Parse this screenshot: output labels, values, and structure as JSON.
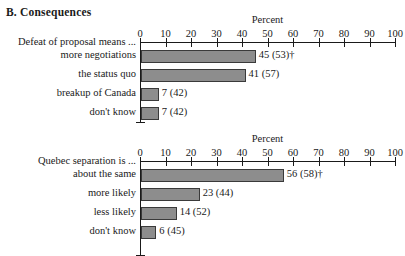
{
  "panel": {
    "title": "B. Consequences"
  },
  "chart_data": [
    {
      "type": "bar",
      "orientation": "horizontal",
      "title": "",
      "xlabel": "Percent",
      "ylabel": "Defeat of proposal means ...",
      "group_label": "Defeat of proposal means ...",
      "xlim": [
        0,
        100
      ],
      "xticks": [
        0,
        10,
        20,
        30,
        40,
        50,
        60,
        70,
        80,
        90,
        100
      ],
      "xticklabels": [
        "0",
        "10",
        "20",
        "30",
        "40",
        "50",
        "60",
        "70",
        "80",
        "90",
        "100"
      ],
      "grid": false,
      "legend": "none",
      "categories": [
        "more negotiations",
        "the status quo",
        "breakup of Canada",
        "don't know"
      ],
      "values": [
        45,
        41,
        7,
        7
      ],
      "data_labels": [
        "45 (53)†",
        "41 (57)",
        "7 (42)",
        "7 (42)"
      ],
      "secondary_values": [
        53,
        57,
        42,
        42
      ]
    },
    {
      "type": "bar",
      "orientation": "horizontal",
      "title": "",
      "xlabel": "Percent",
      "ylabel": "Quebec separation is ...",
      "group_label": "Quebec separation is ...",
      "xlim": [
        0,
        100
      ],
      "xticks": [
        0,
        10,
        20,
        30,
        40,
        50,
        60,
        70,
        80,
        90,
        100
      ],
      "xticklabels": [
        "0",
        "10",
        "20",
        "30",
        "40",
        "50",
        "60",
        "70",
        "80",
        "90",
        "100"
      ],
      "grid": false,
      "legend": "none",
      "categories": [
        "about the same",
        "more likely",
        "less likely",
        "don't know"
      ],
      "values": [
        56,
        23,
        14,
        6
      ],
      "data_labels": [
        "56 (58)†",
        "23 (44)",
        "14 (52)",
        "6 (45)"
      ],
      "secondary_values": [
        58,
        44,
        52,
        45
      ]
    }
  ],
  "style": {
    "bar_fill": "#8d8d8d",
    "bar_stroke": "#3a3a3a",
    "axis_color": "#1a1a1a",
    "background": "#ffffff"
  }
}
